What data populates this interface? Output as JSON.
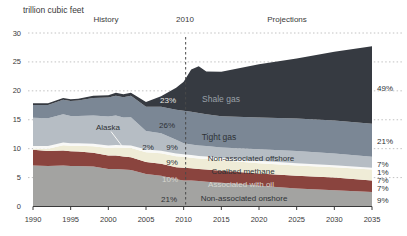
{
  "title": "trillion cubic feet",
  "period_labels": {
    "history": "History",
    "divider_year": "2010",
    "projections": "Projections"
  },
  "colors": {
    "background": "#ffffff",
    "grid": "#c2c2c2",
    "axis": "#3a3a3a",
    "divider": "#4a4a4a",
    "dark_text": "#2e3236",
    "light_text": "#d6d6d0",
    "shale_label_text": "#9aa1a8",
    "callout": "#f7f7f5"
  },
  "chart_data": {
    "type": "area",
    "stacked": true,
    "title": "trillion cubic feet",
    "xlabel": "",
    "ylabel": "trillion cubic feet",
    "xlim": [
      1990,
      2035
    ],
    "ylim": [
      0,
      30
    ],
    "x_ticks": [
      1990,
      1995,
      2000,
      2005,
      2010,
      2015,
      2020,
      2025,
      2030,
      2035
    ],
    "y_ticks": [
      0,
      5,
      10,
      15,
      20,
      25,
      30
    ],
    "grid": "dotted-horizontal",
    "divider_year": 2010,
    "x": [
      1990,
      1992,
      1994,
      1995,
      1996,
      1998,
      2000,
      2001,
      2002,
      2003,
      2005,
      2007,
      2009,
      2010,
      2011,
      2012,
      2013,
      2015,
      2020,
      2025,
      2030,
      2035
    ],
    "series": [
      {
        "name": "Non-associated onshore",
        "color": "#a3a3a1",
        "share_2010": "21%",
        "share_2035": "9%",
        "values": [
          7.1,
          7.0,
          7.1,
          7.0,
          7.0,
          6.9,
          6.5,
          6.5,
          6.4,
          6.3,
          5.6,
          5.3,
          4.7,
          4.5,
          4.5,
          4.4,
          4.3,
          4.1,
          3.6,
          3.1,
          2.8,
          2.5
        ]
      },
      {
        "name": "Associated with oil",
        "color": "#8a443e",
        "share_2010": "10%",
        "share_2035": "7%",
        "values": [
          2.7,
          2.6,
          2.6,
          2.55,
          2.5,
          2.4,
          2.3,
          2.3,
          2.25,
          2.2,
          2.1,
          2.1,
          2.1,
          2.2,
          2.1,
          2.1,
          2.1,
          2.1,
          2.1,
          2.2,
          2.2,
          2.0
        ]
      },
      {
        "name": "Coalbed methane",
        "color": "#efecd7",
        "share_2010": "9%",
        "share_2035": "7%",
        "values": [
          0.2,
          0.4,
          0.9,
          0.95,
          1.0,
          1.1,
          1.3,
          1.4,
          1.5,
          1.6,
          1.7,
          1.8,
          1.9,
          1.9,
          1.85,
          1.8,
          1.8,
          1.8,
          1.8,
          1.8,
          1.8,
          1.9
        ]
      },
      {
        "name": "Alaska",
        "color": "#f9f9f7",
        "share_2010": "2%",
        "share_2035": "1%",
        "values": [
          0.45,
          0.45,
          0.45,
          0.45,
          0.45,
          0.45,
          0.45,
          0.45,
          0.45,
          0.45,
          0.45,
          0.45,
          0.45,
          0.45,
          0.45,
          0.45,
          0.45,
          0.4,
          0.4,
          0.4,
          0.35,
          0.3
        ]
      },
      {
        "name": "Non-associated offshore",
        "color": "#b6bdc4",
        "share_2010": "9%",
        "share_2035": "7%",
        "values": [
          4.9,
          4.8,
          4.9,
          4.7,
          4.7,
          4.9,
          5.0,
          5.1,
          4.8,
          4.9,
          3.2,
          3.0,
          2.4,
          1.9,
          1.8,
          1.8,
          1.8,
          1.8,
          2.0,
          2.1,
          2.0,
          1.9
        ]
      },
      {
        "name": "Tight gas",
        "color": "#7b8795",
        "share_2010": "26%",
        "share_2035": "21%",
        "values": [
          2.2,
          2.3,
          2.5,
          2.6,
          2.7,
          3.0,
          3.3,
          3.4,
          3.5,
          3.7,
          4.2,
          4.6,
          5.2,
          5.6,
          5.7,
          5.6,
          5.5,
          5.4,
          5.5,
          5.6,
          5.7,
          5.7
        ]
      },
      {
        "name": "Shale gas",
        "color": "#363a41",
        "share_2010": "23%",
        "share_2035": "49%",
        "values": [
          0.3,
          0.3,
          0.3,
          0.3,
          0.3,
          0.4,
          0.4,
          0.5,
          0.5,
          0.5,
          0.8,
          1.8,
          3.8,
          5.0,
          7.3,
          8.1,
          7.4,
          7.7,
          9.2,
          10.4,
          11.9,
          13.4
        ]
      }
    ],
    "annotations": [
      {
        "name": "shale-gas-label",
        "text": "Shale gas",
        "x": 221,
        "y": 102,
        "color": "#9aa1a8",
        "size": 8.5,
        "anchor": "middle"
      },
      {
        "name": "tight-gas-label",
        "text": "Tight gas",
        "x": 219,
        "y": 140,
        "color": "#2e3236",
        "size": 8.5,
        "anchor": "middle"
      },
      {
        "name": "offshore-label",
        "text": "Non-associated offshore",
        "x": 251,
        "y": 161,
        "color": "#2e3236",
        "size": 8,
        "anchor": "middle"
      },
      {
        "name": "coalbed-label",
        "text": "Coalbed methane",
        "x": 243,
        "y": 174,
        "color": "#2e3236",
        "size": 8,
        "anchor": "middle"
      },
      {
        "name": "associated-label",
        "text": "Associated with oil",
        "x": 241,
        "y": 186.5,
        "color": "#d6d6d0",
        "size": 8,
        "anchor": "middle"
      },
      {
        "name": "onshore-label",
        "text": "Non-associated onshore",
        "x": 244,
        "y": 201,
        "color": "#2e3236",
        "size": 8,
        "anchor": "middle"
      },
      {
        "name": "alaska-label",
        "text": "Alaska",
        "x": 108,
        "y": 130,
        "color": "#2e3236",
        "size": 8,
        "anchor": "middle"
      },
      {
        "name": "share-2010-shale",
        "text": "23%",
        "x": 168,
        "y": 103,
        "color": "#e8e8e4",
        "size": 8,
        "anchor": "middle"
      },
      {
        "name": "share-2010-tight",
        "text": "26%",
        "x": 167,
        "y": 128,
        "color": "#2e3236",
        "size": 8,
        "anchor": "middle"
      },
      {
        "name": "share-2010-alaska",
        "text": "2%",
        "x": 148,
        "y": 149.5,
        "color": "#2e3236",
        "size": 8,
        "anchor": "middle"
      },
      {
        "name": "share-2010-offshore",
        "text": "9%",
        "x": 172,
        "y": 149.5,
        "color": "#2e3236",
        "size": 8,
        "anchor": "middle"
      },
      {
        "name": "share-2010-coalbed",
        "text": "9%",
        "x": 172,
        "y": 164.5,
        "color": "#2e3236",
        "size": 8,
        "anchor": "middle"
      },
      {
        "name": "share-2010-associated",
        "text": "10%",
        "x": 170,
        "y": 181.5,
        "color": "#d6d6d0",
        "size": 8,
        "anchor": "middle"
      },
      {
        "name": "share-2010-onshore",
        "text": "21%",
        "x": 169,
        "y": 201.5,
        "color": "#2e3236",
        "size": 8,
        "anchor": "middle"
      },
      {
        "name": "share-2035-shale",
        "text": "49%",
        "x": 377,
        "y": 91,
        "color": "#2e3236",
        "size": 8,
        "anchor": "start"
      },
      {
        "name": "share-2035-tight",
        "text": "21%",
        "x": 377,
        "y": 144,
        "color": "#2e3236",
        "size": 8,
        "anchor": "start"
      },
      {
        "name": "share-2035-offshore",
        "text": "7%",
        "x": 377,
        "y": 166.5,
        "color": "#2e3236",
        "size": 8,
        "anchor": "start"
      },
      {
        "name": "share-2035-alaska",
        "text": "1%",
        "x": 377,
        "y": 174.5,
        "color": "#2e3236",
        "size": 8,
        "anchor": "start"
      },
      {
        "name": "share-2035-coalbed",
        "text": "7%",
        "x": 377,
        "y": 183,
        "color": "#2e3236",
        "size": 8,
        "anchor": "start"
      },
      {
        "name": "share-2035-associated",
        "text": "7%",
        "x": 377,
        "y": 191,
        "color": "#2e3236",
        "size": 8,
        "anchor": "start"
      },
      {
        "name": "share-2035-onshore",
        "text": "9%",
        "x": 377,
        "y": 203,
        "color": "#2e3236",
        "size": 8,
        "anchor": "start"
      }
    ],
    "alaska_callout": {
      "x1": 111,
      "y1": 131.5,
      "x2": 122,
      "y2": 146
    }
  }
}
